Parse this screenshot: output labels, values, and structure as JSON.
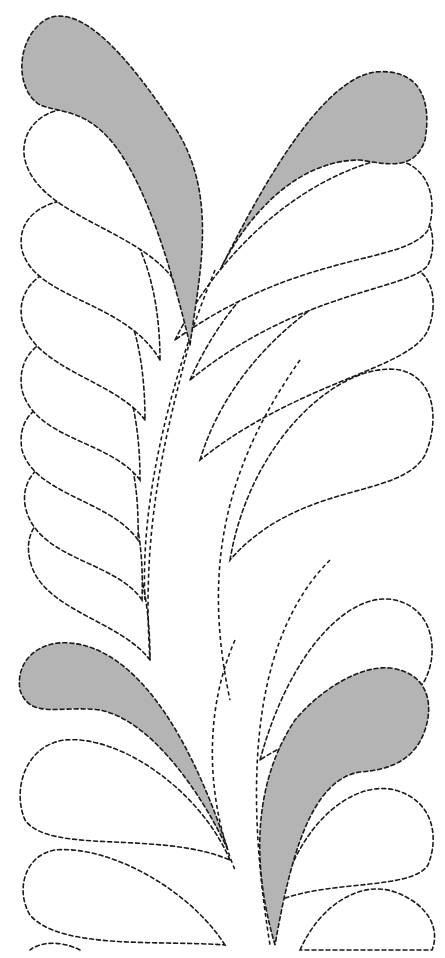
{
  "figure": {
    "colors": {
      "background": "#ffffff",
      "stitch_line": "#1a1a1a",
      "shaded_plume": "#b4b4b4"
    },
    "line_style": "dashed",
    "shaded_plume_count": 4
  }
}
